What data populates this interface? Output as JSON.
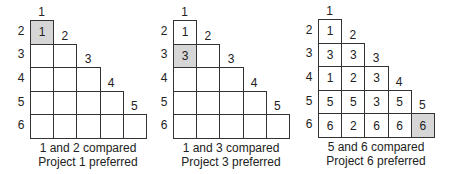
{
  "diagram": {
    "highlight_color": "#d6d6d6",
    "panels": [
      {
        "caption_line1": "1 and 2 compared",
        "caption_line2": "Project 1 preferred",
        "col_labels": [
          "1",
          "2",
          "3",
          "4",
          "5"
        ],
        "row_labels": [
          "2",
          "3",
          "4",
          "5",
          "6"
        ],
        "rows": [
          [
            ""
          ],
          [
            "",
            ""
          ],
          [
            "",
            "",
            ""
          ],
          [
            "",
            "",
            "",
            ""
          ],
          [
            "",
            "",
            "",
            "",
            ""
          ]
        ],
        "values": {
          "r0c0": "1"
        },
        "highlight": [
          0,
          0
        ]
      },
      {
        "caption_line1": "1 and 3 compared",
        "caption_line2": "Project 3 preferred",
        "col_labels": [
          "1",
          "2",
          "3",
          "4",
          "5"
        ],
        "row_labels": [
          "2",
          "3",
          "4",
          "5",
          "6"
        ],
        "values": {
          "r0c0": "1",
          "r1c0": "3"
        },
        "highlight": [
          1,
          0
        ]
      },
      {
        "caption_line1": "5 and 6 compared",
        "caption_line2": "Project 6 preferred",
        "col_labels": [
          "1",
          "2",
          "3",
          "4",
          "5"
        ],
        "row_labels": [
          "2",
          "3",
          "4",
          "5",
          "6"
        ],
        "values": {
          "r0c0": "1",
          "r1c0": "3",
          "r1c1": "3",
          "r2c0": "1",
          "r2c1": "2",
          "r2c2": "3",
          "r3c0": "5",
          "r3c1": "5",
          "r3c2": "3",
          "r3c3": "5",
          "r4c0": "6",
          "r4c1": "2",
          "r4c2": "6",
          "r4c3": "6",
          "r4c4": "6"
        },
        "highlight": [
          4,
          4
        ]
      }
    ]
  }
}
